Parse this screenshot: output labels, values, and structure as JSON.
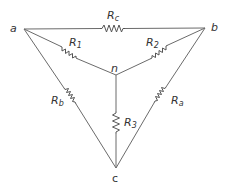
{
  "diagram": {
    "title": "",
    "type": "circuit-delta-wye",
    "nodes": [
      {
        "id": "a",
        "label": "a"
      },
      {
        "id": "b",
        "label": "b"
      },
      {
        "id": "n",
        "label": "n"
      },
      {
        "id": "c",
        "label": "c"
      }
    ],
    "resistors": [
      {
        "id": "Rc",
        "symbol": "R",
        "subscript": "c",
        "between": [
          "a",
          "b"
        ]
      },
      {
        "id": "R1",
        "symbol": "R",
        "subscript": "1",
        "between": [
          "a",
          "n"
        ]
      },
      {
        "id": "R2",
        "symbol": "R",
        "subscript": "2",
        "between": [
          "b",
          "n"
        ]
      },
      {
        "id": "Rb",
        "symbol": "R",
        "subscript": "b",
        "between": [
          "a",
          "c"
        ]
      },
      {
        "id": "Ra",
        "symbol": "R",
        "subscript": "a",
        "between": [
          "b",
          "c"
        ]
      },
      {
        "id": "R3",
        "symbol": "R",
        "subscript": "3",
        "between": [
          "n",
          "c"
        ]
      }
    ],
    "colors": {
      "wire": "#6b6b6b",
      "text": "#333333",
      "background": "#ffffff"
    }
  }
}
